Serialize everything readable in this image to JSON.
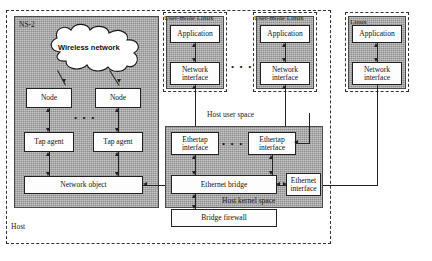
{
  "diagram": {
    "outer_container_label": "Host",
    "colors": {
      "panel_gray": "#a9a9a9",
      "box_white": "#fdfdfd",
      "line": "#222222",
      "dash_border": "#333333"
    }
  },
  "ns2": {
    "label": "NS-2",
    "cloud_label": "Wireless network",
    "nodes": [
      {
        "label": "Node"
      },
      {
        "label": "Node"
      }
    ],
    "tap_agents": [
      {
        "label": "Tap agent"
      },
      {
        "label": "Tap agent"
      }
    ],
    "network_object": "Network object",
    "ellipsis": "• • •"
  },
  "uml_instances": [
    {
      "label": "User-mode Linux",
      "application": "Application",
      "network_interface": "Network\ninterface",
      "network_interface_line1": "Network",
      "network_interface_line2": "interface"
    },
    {
      "label": "User-mode Linux",
      "application": "Application",
      "network_interface_line1": "Network",
      "network_interface_line2": "interface"
    }
  ],
  "uml_ellipsis": "• • •",
  "linux_box": {
    "label": "Linux",
    "application": "Application",
    "network_interface_line1": "Network",
    "network_interface_line2": "interface"
  },
  "host_user_space": {
    "label": "Host user space"
  },
  "host_kernel_space": {
    "label": "Host kernel space",
    "ethertap_interfaces": [
      {
        "line1": "Ethertap",
        "line2": "interface"
      },
      {
        "line1": "Ethertap",
        "line2": "interface"
      }
    ],
    "ethertap_ellipsis": "• • •",
    "ethernet_bridge": "Ethernet bridge",
    "bridge_firewall": "Bridge firewall",
    "ethernet_interface_line1": "Ethernet",
    "ethernet_interface_line2": "interface"
  }
}
